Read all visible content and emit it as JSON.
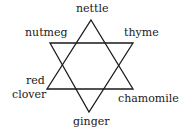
{
  "diagram": {
    "type": "hexagram",
    "stroke_color": "#1a1a1a",
    "background": "#ffffff",
    "up_triangle": [
      [
        91,
        20
      ],
      [
        133,
        89
      ],
      [
        47,
        89
      ]
    ],
    "down_triangle": [
      [
        50,
        43
      ],
      [
        133,
        43
      ],
      [
        89,
        112
      ]
    ],
    "labels": {
      "top": "nettle",
      "upper_left": "nutmeg",
      "upper_right": "thyme",
      "lower_left_line1": "red",
      "lower_left_line2": "clover",
      "lower_right": "chamomile",
      "bottom": "ginger"
    }
  }
}
